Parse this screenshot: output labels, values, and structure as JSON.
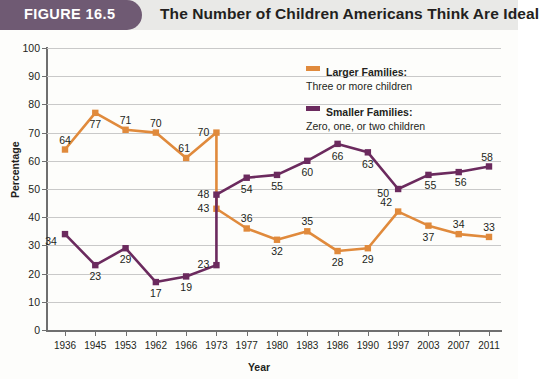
{
  "header": {
    "badge": "FIGURE 16.5",
    "title": "The Number of Children Americans Think Are Ideal",
    "badge_color": "#6f5a73"
  },
  "legend": {
    "position": "top-right",
    "entries": [
      {
        "name": "Larger Families:",
        "sub": "Three or more children",
        "color": "#e08a3c"
      },
      {
        "name": "Smaller Families:",
        "sub": "Zero, one, or two children",
        "color": "#6b2a5e"
      }
    ]
  },
  "chart_data": {
    "type": "line",
    "title": "The Number of Children Americans Think Are Ideal",
    "xlabel": "Year",
    "ylabel": "Percentage",
    "ylim": [
      0,
      100
    ],
    "ytick_step": 10,
    "yticks": [
      "0",
      "10",
      "20",
      "30",
      "40",
      "50",
      "60",
      "70",
      "80",
      "90",
      "100"
    ],
    "grid": true,
    "categories": [
      "1936",
      "1945",
      "1953",
      "1962",
      "1966",
      "1973",
      "1977",
      "1980",
      "1983",
      "1986",
      "1990",
      "1997",
      "2003",
      "2007",
      "2011"
    ],
    "series": [
      {
        "name": "Larger Families: Three or more children",
        "color": "#e08a3c",
        "marker": "square",
        "values": [
          64,
          77,
          71,
          70,
          61,
          43,
          36,
          32,
          35,
          28,
          29,
          42,
          37,
          34,
          33
        ],
        "extra_point": {
          "x_index": 5,
          "value": 70,
          "note": "peak immediately before 1973 drop"
        },
        "labels": [
          "64",
          "77",
          "71",
          "70",
          "61",
          "43",
          "36",
          "32",
          "35",
          "28",
          "29",
          "42",
          "37",
          "34",
          "33"
        ]
      },
      {
        "name": "Smaller Families: Zero, one, or two children",
        "color": "#6b2a5e",
        "marker": "square",
        "values": [
          34,
          23,
          29,
          17,
          19,
          48,
          54,
          55,
          60,
          66,
          63,
          50,
          55,
          56,
          58
        ],
        "extra_point": {
          "x_index": 5,
          "value": 23,
          "note": "low point immediately before 1973 rise"
        },
        "labels": [
          "34",
          "23",
          "29",
          "17",
          "19",
          "48",
          "54",
          "55",
          "60",
          "66",
          "63",
          "50",
          "55",
          "56",
          "58"
        ]
      }
    ]
  },
  "axis_titles": {
    "x": "Year",
    "y": "Percentage"
  }
}
